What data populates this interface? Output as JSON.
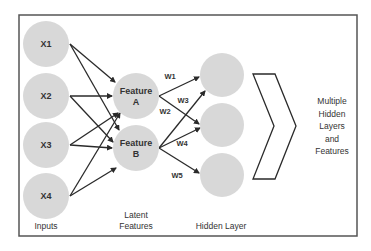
{
  "diagram": {
    "frame": {
      "x": 19,
      "y": 15,
      "width": 338,
      "height": 221,
      "stroke": "#555555"
    },
    "colors": {
      "node_fill": "#d8d8d8",
      "arrow": "#2a2a2a",
      "text": "#333333",
      "chevron_stroke": "#2a2a2a"
    },
    "inputs": [
      {
        "id": "x1",
        "label": "X1",
        "cx": 46,
        "cy": 44,
        "r": 23
      },
      {
        "id": "x2",
        "label": "X2",
        "cx": 46,
        "cy": 96,
        "r": 23
      },
      {
        "id": "x3",
        "label": "X3",
        "cx": 46,
        "cy": 145,
        "r": 23
      },
      {
        "id": "x4",
        "label": "X4",
        "cx": 46,
        "cy": 196,
        "r": 23
      }
    ],
    "features": [
      {
        "id": "fa",
        "label_line1": "Feature",
        "label_line2": "A",
        "cx": 136,
        "cy": 96,
        "r": 23
      },
      {
        "id": "fb",
        "label_line1": "Feature",
        "label_line2": "B",
        "cx": 136,
        "cy": 148,
        "r": 23
      }
    ],
    "hidden": [
      {
        "id": "h1",
        "cx": 222,
        "cy": 75,
        "r": 22
      },
      {
        "id": "h2",
        "cx": 222,
        "cy": 125,
        "r": 22
      },
      {
        "id": "h3",
        "cx": 222,
        "cy": 175,
        "r": 22
      }
    ],
    "input_edges": [
      {
        "from": "x1",
        "to": "fa",
        "x1": 70,
        "y1": 44,
        "x2": 115,
        "y2": 82
      },
      {
        "from": "x1",
        "to": "fb",
        "x1": 70,
        "y1": 44,
        "x2": 119,
        "y2": 130
      },
      {
        "from": "x2",
        "to": "fa",
        "x1": 70,
        "y1": 96,
        "x2": 112,
        "y2": 96
      },
      {
        "from": "x2",
        "to": "fb",
        "x1": 70,
        "y1": 96,
        "x2": 113,
        "y2": 142
      },
      {
        "from": "x3",
        "to": "fa",
        "x1": 70,
        "y1": 145,
        "x2": 118,
        "y2": 113
      },
      {
        "from": "x3",
        "to": "fb",
        "x1": 70,
        "y1": 145,
        "x2": 112,
        "y2": 148
      },
      {
        "from": "x4",
        "to": "fa",
        "x1": 70,
        "y1": 196,
        "x2": 120,
        "y2": 113
      },
      {
        "from": "x4",
        "to": "fb",
        "x1": 70,
        "y1": 196,
        "x2": 116,
        "y2": 168
      }
    ],
    "weighted_edges": [
      {
        "label": "W1",
        "from": "fa",
        "to": "h1",
        "x1": 159,
        "y1": 96,
        "x2": 199,
        "y2": 77,
        "lx": 170,
        "ly": 79
      },
      {
        "label": "W2",
        "from": "fa",
        "to": "h2",
        "x1": 159,
        "y1": 96,
        "x2": 199,
        "y2": 124,
        "lx": 165,
        "ly": 114
      },
      {
        "label": "W3",
        "from": "fb",
        "to": "h1",
        "x1": 159,
        "y1": 148,
        "x2": 205,
        "y2": 91,
        "lx": 183,
        "ly": 103
      },
      {
        "label": "W4",
        "from": "fb",
        "to": "h2",
        "x1": 159,
        "y1": 148,
        "x2": 200,
        "y2": 128,
        "lx": 182,
        "ly": 146
      },
      {
        "label": "W5",
        "from": "fb",
        "to": "h3",
        "x1": 159,
        "y1": 148,
        "x2": 199,
        "y2": 173,
        "lx": 177,
        "ly": 178
      }
    ],
    "chevron": {
      "points": "253,74 275,74 296,126 275,179 253,179 274,126"
    },
    "side_text": {
      "x": 332,
      "lines": [
        "Multiple",
        "Hidden",
        "Layers",
        "and",
        "Features"
      ],
      "y_start": 104,
      "line_height": 12.5
    },
    "captions": {
      "inputs": {
        "text": "Inputs",
        "x": 46,
        "y": 229
      },
      "latent_line1": {
        "text": "Latent",
        "x": 136,
        "y": 218
      },
      "latent_line2": {
        "text": "Features",
        "x": 136,
        "y": 229
      },
      "hidden": {
        "text": "Hidden Layer",
        "x": 221,
        "y": 229
      }
    }
  }
}
